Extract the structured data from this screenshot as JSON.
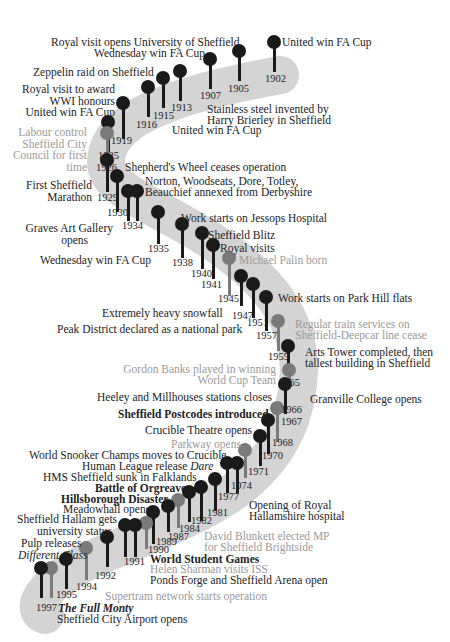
{
  "colors": {
    "band": "#d4d4d4",
    "dark_pin": "#1a1a1a",
    "grey_pin": "#7a7a7a",
    "dark_text": "#222222",
    "grey_text": "#9a9a9a"
  },
  "years": {
    "y1902": "1902",
    "y1905": "1905",
    "y1907": "1907",
    "y1913": "1913",
    "y1915": "1915",
    "y1916": "1916",
    "y1919": "1919",
    "y1925": "1925",
    "y1926": "1926",
    "y1929": "1929",
    "y1930": "1930",
    "y1934": "1934",
    "y1935": "1935",
    "y1938": "1938",
    "y1940": "1940",
    "y1941": "1941",
    "y1945": "1945",
    "y1947": "1947",
    "y1951": "1951",
    "y1957": "1957",
    "y1959": "1959",
    "y1965": "1965",
    "y1966": "1966",
    "y1967": "1967",
    "y1968": "1968",
    "y1970": "1970",
    "y1971": "1971",
    "y1974": "1974",
    "y1977": "1977",
    "y1981": "1981",
    "y1982": "1982",
    "y1984": "1984",
    "y1987": "1987",
    "y1989": "1989",
    "y1990": "1990",
    "y1991": "1991",
    "y1992": "1992",
    "y1994": "1994",
    "y1995": "1995",
    "y1997": "1997"
  },
  "events": {
    "e1902": "United win FA Cup",
    "e1905": "Royal visit opens University of Sheffield",
    "e1907": "Wednesday win FA Cup",
    "e1913a": "Stainless steel invented by",
    "e1913b": "Harry Brierley in Sheffield",
    "e1915": "United win FA Cup",
    "e1916": "Zeppelin raid on Sheffield",
    "e1919a": "Royal visit to award",
    "e1919b": "WWI honours",
    "e1925": "United win FA Cup",
    "e1926a": "Labour control",
    "e1926b": "Sheffield City",
    "e1926c": "Council for first",
    "e1926d": "time",
    "e1929": "Shepherd's Wheel ceases operation",
    "e1930a": "Norton, Woodseats, Dore, Totley,",
    "e1930b": "Beauchief  annexed from Derbyshire",
    "e1926m1": "First Sheffield",
    "e1926m2": "Marathon",
    "e1934a": "Graves Art Gallery",
    "e1934b": "opens",
    "e1935w": "Wednesday win FA Cup",
    "e1938": "Work starts on Jessops Hospital",
    "e1940": "Sheffield Blitz",
    "e1941": "Royal visits",
    "e1943": "Michael Palin born",
    "e1947": "Extremely heavy snowfall",
    "e1951": "Peak District declared as a national park",
    "e1957": "Work starts on Park Hill flats",
    "e1959a": "Regular train services on",
    "e1959b": "Sheffield-Deepcar line cease",
    "e1965a": "Arts Tower completed, then",
    "e1965b": "tallest building in Sheffield",
    "e1966a": "Gordon Banks played in winning",
    "e1966b": "World Cup Team",
    "e1967h": "Heeley and Millhouses stations closes",
    "e1967g": "Granville College opens",
    "e1968": "Sheffield Postcodes introduced",
    "e1971c": "Crucible Theatre opens",
    "e1974p": "Parkway opens",
    "e1977s": "World Snooker Champs moves to Crucible",
    "e1981h_pre": "Human League release ",
    "e1981h_it": "Dare",
    "e1982f": "HMS Sheffield sunk in Falklands",
    "e1984o": "Battle of  Orgreave",
    "e1989h": "Hillsborough Disaster",
    "e1990m": "Meadowhall opens",
    "e1992a": "Sheffield Hallam gets",
    "e1992b": "university status",
    "e1995a": "Pulp releases",
    "e1995b": "Different Class",
    "e1978a": "Opening of  Royal",
    "e1978b": "Hallamshire hospital",
    "e1987a": "David Blunkett elected MP",
    "e1987b": "for Sheffield Brightside",
    "e1991w": "World Student Games",
    "e1991h": "Helen Sharman visits ISS",
    "e1991p": "Ponds Forge and Sheffield Arena open",
    "e1994s": "Supertram network starts operation",
    "e1997f": "The Full Monty",
    "e1997a": "Sheffield City Airport opens"
  }
}
